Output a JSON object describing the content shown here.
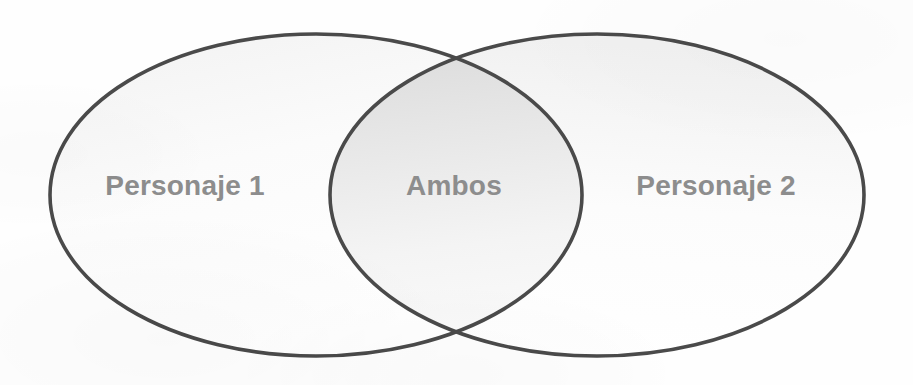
{
  "diagram": {
    "type": "venn",
    "title": "",
    "background_color": "#fefefe",
    "stroke_color": "#4a4a4a",
    "label_color": "#8d8d8d",
    "sets": [
      {
        "id": "left",
        "label": "Personaje 1",
        "label_x": 185,
        "label_y": 195,
        "center_x": 316,
        "center_y": 195,
        "radius_x": 266,
        "radius_y": 161
      },
      {
        "id": "right",
        "label": "Personaje 2",
        "label_x": 716,
        "label_y": 195,
        "center_x": 597,
        "center_y": 195,
        "radius_x": 267,
        "radius_y": 161
      }
    ],
    "intersection": {
      "id": "both",
      "label": "Ambos",
      "label_x": 454,
      "label_y": 195
    }
  }
}
